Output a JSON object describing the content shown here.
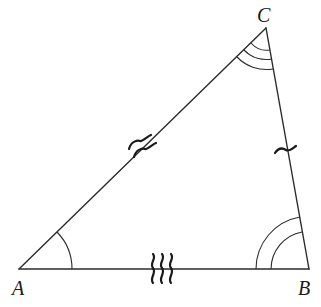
{
  "diagram": {
    "type": "triangle",
    "vertices": [
      {
        "label": "A",
        "x": 19,
        "y": 269
      },
      {
        "label": "B",
        "x": 309,
        "y": 269
      },
      {
        "label": "C",
        "x": 266,
        "y": 28
      }
    ],
    "sides": [
      {
        "name": "AB",
        "tick_marks": 3,
        "tick_style": "wavy"
      },
      {
        "name": "BC",
        "tick_marks": 1,
        "tick_style": "wavy"
      },
      {
        "name": "AC",
        "tick_marks": 2,
        "tick_style": "wavy"
      }
    ],
    "angles": [
      {
        "vertex": "A",
        "arc_count": 1
      },
      {
        "vertex": "B",
        "arc_count": 2
      },
      {
        "vertex": "C",
        "arc_count": 3
      }
    ],
    "colors": {
      "stroke": "#2b2b2b",
      "background": "#ffffff"
    }
  }
}
